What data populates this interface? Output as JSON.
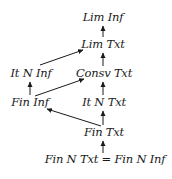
{
  "diagram": {
    "nodes": {
      "lim_inf": {
        "label": "Lim Inf",
        "x": 103,
        "y": 18
      },
      "lim_txt": {
        "label": "Lim Txt",
        "x": 103,
        "y": 45
      },
      "it_n_inf": {
        "label": "It N Inf",
        "x": 31,
        "y": 74
      },
      "consv_txt": {
        "label": "Consv Txt",
        "x": 104,
        "y": 74
      },
      "fin_inf": {
        "label": "Fin Inf",
        "x": 30,
        "y": 103
      },
      "it_n_txt": {
        "label": "It N Txt",
        "x": 104,
        "y": 103
      },
      "fin_txt": {
        "label": "Fin Txt",
        "x": 104,
        "y": 133
      },
      "fin_n_txt_eq": {
        "label": "Fin N Txt = Fin N Inf",
        "x": 105,
        "y": 160
      }
    },
    "edges": [
      {
        "from": "lim_txt",
        "to": "lim_inf"
      },
      {
        "from": "it_n_inf",
        "to": "lim_txt"
      },
      {
        "from": "consv_txt",
        "to": "lim_txt"
      },
      {
        "from": "fin_inf",
        "to": "it_n_inf"
      },
      {
        "from": "fin_inf",
        "to": "consv_txt"
      },
      {
        "from": "it_n_txt",
        "to": "consv_txt"
      },
      {
        "from": "fin_txt",
        "to": "it_n_txt"
      },
      {
        "from": "fin_txt",
        "to": "fin_inf"
      },
      {
        "from": "fin_n_txt_eq",
        "to": "fin_txt"
      }
    ],
    "colors": {
      "ink": "#1a1a1a",
      "background": "#ffffff"
    }
  }
}
